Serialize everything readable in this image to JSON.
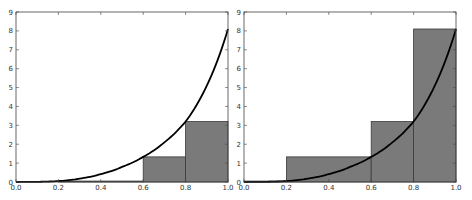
{
  "chart_data": [
    {
      "type": "bar",
      "title": "",
      "xlabel": "",
      "ylabel": "",
      "description": "Left-endpoint Riemann sum with curve overlay",
      "xlim": [
        0.0,
        1.0
      ],
      "ylim": [
        0,
        9
      ],
      "xticks": [
        "0.0",
        "0.2",
        "0.4",
        "0.6",
        "0.8",
        "1.0"
      ],
      "yticks": [
        "0",
        "1",
        "2",
        "3",
        "4",
        "5",
        "6",
        "7",
        "8",
        "9"
      ],
      "grid": false,
      "legend": null,
      "bars": [
        {
          "x0": 0.0,
          "x1": 0.2,
          "height": 0.0
        },
        {
          "x0": 0.2,
          "x1": 0.6,
          "height": 0.05
        },
        {
          "x0": 0.6,
          "x1": 0.8,
          "height": 1.33
        },
        {
          "x0": 0.8,
          "x1": 1.0,
          "height": 3.2
        }
      ],
      "curve": {
        "x": [
          0.0,
          0.1,
          0.2,
          0.3,
          0.4,
          0.5,
          0.6,
          0.7,
          0.8,
          0.9,
          1.0
        ],
        "y": [
          0.0,
          0.01,
          0.05,
          0.18,
          0.42,
          0.8,
          1.33,
          2.1,
          3.2,
          5.1,
          8.1
        ]
      }
    },
    {
      "type": "bar",
      "title": "",
      "xlabel": "",
      "ylabel": "",
      "description": "Right-endpoint Riemann sum with curve overlay",
      "xlim": [
        0.0,
        1.0
      ],
      "ylim": [
        0,
        9
      ],
      "xticks": [
        "0.0",
        "0.2",
        "0.4",
        "0.6",
        "0.8",
        "1.0"
      ],
      "yticks": [
        "0",
        "1",
        "2",
        "3",
        "4",
        "5",
        "6",
        "7",
        "8",
        "9"
      ],
      "grid": false,
      "legend": null,
      "bars": [
        {
          "x0": 0.0,
          "x1": 0.2,
          "height": 0.05
        },
        {
          "x0": 0.2,
          "x1": 0.6,
          "height": 1.33
        },
        {
          "x0": 0.6,
          "x1": 0.8,
          "height": 3.2
        },
        {
          "x0": 0.8,
          "x1": 1.0,
          "height": 8.1
        }
      ],
      "curve": {
        "x": [
          0.0,
          0.1,
          0.2,
          0.3,
          0.4,
          0.5,
          0.6,
          0.7,
          0.8,
          0.9,
          1.0
        ],
        "y": [
          0.0,
          0.01,
          0.05,
          0.18,
          0.42,
          0.8,
          1.33,
          2.1,
          3.2,
          5.1,
          8.1
        ]
      }
    }
  ],
  "style": {
    "bar_fill": "#7a7a7a",
    "bar_edge": "#3a3a3a",
    "curve_color": "#000000",
    "axis_color": "#444444"
  }
}
